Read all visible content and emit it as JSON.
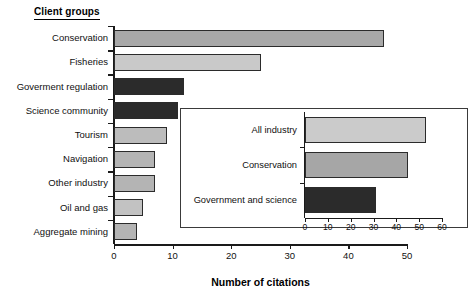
{
  "chart_data": [
    {
      "id": "main",
      "type": "bar",
      "orientation": "horizontal",
      "title": "Client groups",
      "xlabel": "Number of citations",
      "ylabel": "",
      "xlim": [
        0,
        50
      ],
      "xticks": [
        0,
        10,
        20,
        30,
        40,
        50
      ],
      "grid": false,
      "legend": "none",
      "categories": [
        "Conservation",
        "Fisheries",
        "Goverment regulation",
        "Science community",
        "Tourism",
        "Navigation",
        "Other industry",
        "Oil and gas",
        "Aggregate mining"
      ],
      "values": [
        46,
        25,
        12,
        11,
        9,
        7,
        7,
        5,
        4
      ],
      "bar_colors": [
        "#a8a8a8",
        "#c9c9c9",
        "#2b2b2b",
        "#2b2b2b",
        "#bcbcbc",
        "#b4b4b4",
        "#b4b4b4",
        "#c2c2c2",
        "#b4b4b4"
      ]
    },
    {
      "id": "inset",
      "type": "bar",
      "orientation": "horizontal",
      "title": "",
      "xlabel": "",
      "ylabel": "",
      "xlim": [
        0,
        60
      ],
      "xticks": [
        0,
        10,
        20,
        30,
        40,
        50,
        60
      ],
      "grid": false,
      "legend": "none",
      "categories": [
        "All industry",
        "Conservation",
        "Government and science"
      ],
      "values": [
        53,
        45,
        31
      ],
      "bar_colors": [
        "#cbcbcb",
        "#a6a6a6",
        "#2b2b2b"
      ]
    }
  ],
  "colors": {
    "axis": "#1a1a1a",
    "background": "#ffffff",
    "bar_light": "#cbcbcb",
    "bar_mid": "#a8a8a8",
    "bar_dark": "#2b2b2b"
  }
}
